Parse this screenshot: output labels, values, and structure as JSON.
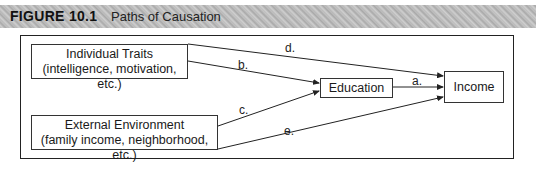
{
  "figure": {
    "number": "FIGURE 10.1",
    "title": "Paths of Causation"
  },
  "nodes": {
    "individual_traits": {
      "line1": "Individual Traits",
      "line2": "(intelligence, motivation, etc.)"
    },
    "external_environment": {
      "line1": "External Environment",
      "line2": "(family income, neighborhood, etc.)"
    },
    "education": {
      "label": "Education"
    },
    "income": {
      "label": "Income"
    }
  },
  "paths": {
    "a": {
      "label": "a.",
      "from": "Education",
      "to": "Income"
    },
    "b": {
      "label": "b.",
      "from": "Individual Traits",
      "to": "Education"
    },
    "c": {
      "label": "c.",
      "from": "External Environment",
      "to": "Education"
    },
    "d": {
      "label": "d.",
      "from": "Individual Traits",
      "to": "Income"
    },
    "e": {
      "label": "e.",
      "from": "External Environment",
      "to": "Income"
    }
  },
  "colors": {
    "line": "#222222",
    "header_bg": "#bdbdbd"
  }
}
